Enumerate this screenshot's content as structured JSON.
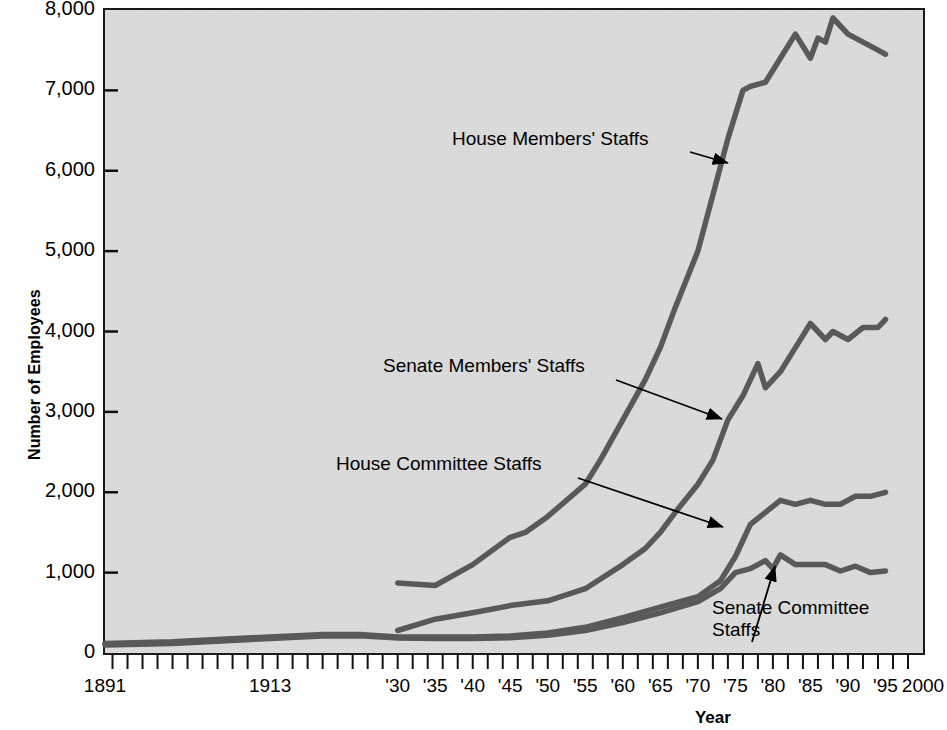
{
  "chart_data": {
    "type": "line",
    "title": "",
    "xlabel": "Year",
    "ylabel": "Number of Employees",
    "xlim": [
      1891,
      2000
    ],
    "ylim": [
      0,
      8000
    ],
    "grid": false,
    "legend_position": "inline-annotations",
    "y_ticks": [
      "0",
      "1,000",
      "2,000",
      "3,000",
      "4,000",
      "5,000",
      "6,000",
      "7,000",
      "8,000"
    ],
    "y_tick_values": [
      0,
      1000,
      2000,
      3000,
      4000,
      5000,
      6000,
      7000,
      8000
    ],
    "x_ticks": [
      "1891",
      "1913",
      "'30",
      "'35",
      "'40",
      "'45",
      "'50",
      "'55",
      "'60",
      "'65",
      "'70",
      "'75",
      "'80",
      "'85",
      "'90",
      "'95",
      "2000"
    ],
    "x_tick_values": [
      1891,
      1913,
      1930,
      1935,
      1940,
      1945,
      1950,
      1955,
      1960,
      1965,
      1970,
      1975,
      1980,
      1985,
      1990,
      1995,
      2000
    ],
    "minor_tick_interval_years": 2,
    "series": [
      {
        "name": "House Members' Staffs",
        "color": "#595959",
        "x": [
          1930,
          1935,
          1940,
          1945,
          1947,
          1950,
          1955,
          1957,
          1960,
          1963,
          1965,
          1967,
          1970,
          1972,
          1974,
          1976,
          1977,
          1979,
          1981,
          1983,
          1985,
          1986,
          1987,
          1988,
          1990,
          1992,
          1994,
          1995
        ],
        "y": [
          870,
          840,
          1100,
          1440,
          1500,
          1700,
          2100,
          2400,
          2900,
          3400,
          3800,
          4300,
          5000,
          5700,
          6400,
          7000,
          7050,
          7100,
          7400,
          7700,
          7400,
          7650,
          7600,
          7900,
          7700,
          7600,
          7500,
          7450
        ]
      },
      {
        "name": "Senate Members' Staffs",
        "color": "#595959",
        "x": [
          1930,
          1935,
          1940,
          1945,
          1950,
          1955,
          1960,
          1963,
          1965,
          1967,
          1970,
          1972,
          1974,
          1976,
          1978,
          1979,
          1981,
          1983,
          1985,
          1987,
          1988,
          1990,
          1992,
          1994,
          1995
        ],
        "y": [
          280,
          420,
          500,
          590,
          650,
          800,
          1100,
          1300,
          1500,
          1750,
          2100,
          2400,
          2900,
          3200,
          3600,
          3300,
          3500,
          3800,
          4100,
          3900,
          4000,
          3900,
          4050,
          4050,
          4150
        ]
      },
      {
        "name": "House Committee Staffs",
        "color": "#595959",
        "x": [
          1891,
          1900,
          1913,
          1920,
          1925,
          1930,
          1935,
          1940,
          1945,
          1950,
          1955,
          1960,
          1965,
          1970,
          1973,
          1975,
          1977,
          1979,
          1981,
          1983,
          1985,
          1987,
          1989,
          1991,
          1993,
          1995
        ],
        "y": [
          120,
          140,
          200,
          230,
          230,
          200,
          200,
          200,
          210,
          250,
          320,
          440,
          570,
          700,
          900,
          1200,
          1600,
          1750,
          1900,
          1850,
          1900,
          1850,
          1850,
          1950,
          1950,
          2000
        ]
      },
      {
        "name": "Senate Committee Staffs",
        "color": "#595959",
        "x": [
          1891,
          1900,
          1913,
          1920,
          1925,
          1930,
          1935,
          1940,
          1945,
          1950,
          1955,
          1960,
          1965,
          1970,
          1973,
          1975,
          1977,
          1979,
          1980,
          1981,
          1983,
          1985,
          1987,
          1989,
          1991,
          1993,
          1995
        ],
        "y": [
          100,
          120,
          180,
          210,
          215,
          185,
          180,
          180,
          190,
          220,
          280,
          380,
          500,
          640,
          800,
          1000,
          1050,
          1150,
          1050,
          1220,
          1100,
          1100,
          1100,
          1020,
          1080,
          1000,
          1020
        ]
      }
    ],
    "annotations": [
      {
        "text": "House Members' Staffs",
        "label_x": 452,
        "label_y": 128,
        "arrow_from": [
          690,
          152
        ],
        "arrow_to": [
          728,
          163
        ]
      },
      {
        "text": "Senate Members' Staffs",
        "label_x": 383,
        "label_y": 355,
        "arrow_from": [
          616,
          380
        ],
        "arrow_to": [
          722,
          419
        ]
      },
      {
        "text": "House Committee Staffs",
        "label_x": 336,
        "label_y": 453,
        "arrow_from": [
          578,
          478
        ],
        "arrow_to": [
          723,
          527
        ]
      },
      {
        "text": "Senate Committee Staffs",
        "label_x": 712,
        "label_y": 597,
        "arrow_from": [
          752,
          642
        ],
        "arrow_to": [
          775,
          566
        ]
      }
    ]
  },
  "axes": {
    "y_axis_title": "Number of Employees",
    "x_axis_title": "Year"
  }
}
